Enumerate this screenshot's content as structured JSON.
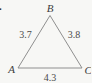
{
  "figure": {
    "leading_mark": ".",
    "vertices": {
      "A": "A",
      "B": "B",
      "C": "C"
    },
    "sides": {
      "AB": "3.7",
      "BC": "3.8",
      "AC": "4.3"
    },
    "colors": {
      "background": "#f7f7f5",
      "edge": "#8f8f8f",
      "text": "#3d3d3d"
    }
  }
}
